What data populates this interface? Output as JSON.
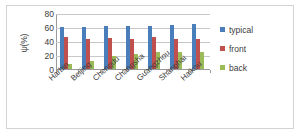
{
  "chart_data": {
    "type": "bar",
    "title": "",
    "xlabel": "",
    "ylabel": "ψ(%)",
    "ylim": [
      0,
      80
    ],
    "yticks": [
      80,
      60,
      40,
      20,
      0
    ],
    "grid": true,
    "legend_position": "right",
    "categories": [
      "Harbin",
      "Beijing",
      "Chengdu",
      "Changsha",
      "Guangzhou",
      "Shanghai",
      "Haikou"
    ],
    "series": [
      {
        "name": "typical",
        "color": "#4a7ebb",
        "values": [
          60,
          60,
          61,
          61,
          62,
          63,
          64
        ]
      },
      {
        "name": "front",
        "color": "#c0504d",
        "values": [
          46,
          43,
          44,
          43,
          46,
          43,
          43
        ]
      },
      {
        "name": "back",
        "color": "#9bbb59",
        "values": [
          7,
          11,
          19,
          21,
          24,
          25,
          25
        ]
      }
    ]
  },
  "legend": {
    "items": [
      {
        "label": "typical",
        "color": "#4a7ebb"
      },
      {
        "label": "front",
        "color": "#c0504d"
      },
      {
        "label": "back",
        "color": "#9bbb59"
      }
    ]
  }
}
